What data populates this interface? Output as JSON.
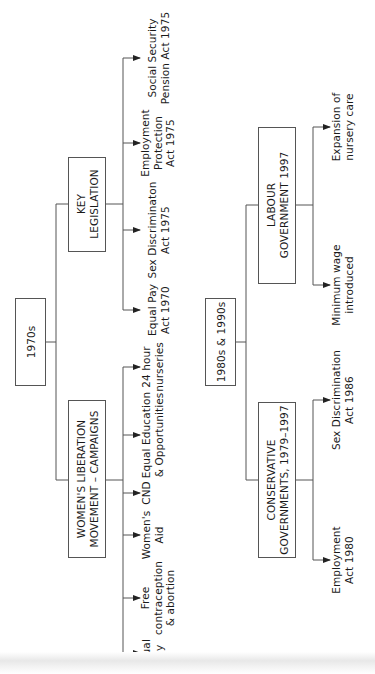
{
  "diagram": {
    "orientation": "rotated 90deg counter-clockwise",
    "root_1970s": {
      "label": "1970s",
      "children": {
        "key_legislation": {
          "label": "KEY\nLEGISLATION",
          "leaves": [
            "Equal Pay\nAct 1970",
            "Sex Discriminaton\nAct 1975",
            "Employment\nProtection\nAct 1975",
            "Social Security\nPension Act 1975"
          ]
        },
        "womens_lib": {
          "label": "WOMEN'S LIBERATION\nMOVEMENT – CAMPAIGNS",
          "leaves": [
            "Equal\nPay",
            "Free\ncontraception\n& abortion",
            "Women's\nAid",
            "CND",
            "Equal Education\n& Opportunities",
            "24 hour\nnurseries"
          ]
        }
      }
    },
    "root_1980s": {
      "label": "1980s & 1990s",
      "children": {
        "labour": {
          "label": "LABOUR\nGOVERNMENT 1997",
          "leaves": [
            "Minimum wage\nintroduced",
            "Expansion of\nnursery care"
          ]
        },
        "conservative": {
          "label": "CONSERVATIVE\nGOVERNMENTS, 1979–1997",
          "leaves": [
            "Employment\nAct 1980",
            "Sex Discrimination\nAct 1986"
          ]
        }
      }
    },
    "colors": {
      "line": "#555555",
      "text": "#1a1a1a",
      "background": "#ffffff"
    }
  }
}
